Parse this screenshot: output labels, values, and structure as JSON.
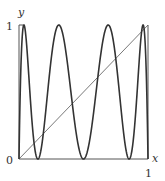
{
  "chart_data": {
    "type": "line",
    "title": "",
    "xlabel": "x",
    "ylabel": "y",
    "xlim": [
      0,
      1
    ],
    "ylim": [
      0,
      1
    ],
    "grid": false,
    "legend": null,
    "x_tick_labels": {
      "origin": "0",
      "end": "1"
    },
    "y_tick_labels": {
      "end": "1"
    },
    "series": [
      {
        "name": "f^3(x), logistic map 4x(1-x) third iterate",
        "function": "L(L(L(x))) where L(x)=4x(1-x)",
        "maxima_x": [
          0.04,
          0.31,
          0.69,
          0.96
        ],
        "minima_x": [
          0.0,
          0.146,
          0.5,
          0.854,
          1.0
        ],
        "stroke": "#333333",
        "stroke_width": 1.6
      },
      {
        "name": "y = x",
        "x": [
          0,
          1
        ],
        "y": [
          0,
          1
        ],
        "stroke": "#555555",
        "stroke_width": 0.8
      }
    ]
  },
  "labels": {
    "y_axis": "y",
    "x_axis": "x",
    "origin": "0",
    "y_one": "1",
    "x_one": "1"
  }
}
